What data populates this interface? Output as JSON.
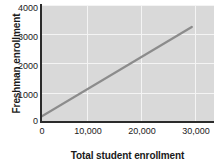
{
  "chart_data": {
    "type": "line",
    "title": "",
    "xlabel": "Total student enrollment",
    "ylabel": "Freshman enrollment",
    "xlim": [
      0,
      35000
    ],
    "ylim": [
      0,
      4000
    ],
    "grid": true,
    "legend": null,
    "x_ticks": [
      {
        "value": 0,
        "label": "0"
      },
      {
        "value": 10000,
        "label": "10,000"
      },
      {
        "value": 20000,
        "label": "20,000"
      },
      {
        "value": 30000,
        "label": "30,000"
      }
    ],
    "y_ticks": [
      {
        "value": 0,
        "label": "0"
      },
      {
        "value": 1000,
        "label": "1000"
      },
      {
        "value": 2000,
        "label": "2000"
      },
      {
        "value": 3000,
        "label": "3000"
      },
      {
        "value": 4000,
        "label": "4000"
      }
    ],
    "series": [
      {
        "name": "trend-line",
        "color": "#8c8c8c",
        "x": [
          0,
          30500
        ],
        "values": [
          180,
          3250
        ]
      }
    ]
  },
  "style": {
    "plot_background": "#d9d9d9",
    "gridline_color": "#f4f4f4",
    "axis_color": "#2b2b2b",
    "line_color": "#8c8c8c",
    "text_color": "#1a1a1a"
  }
}
